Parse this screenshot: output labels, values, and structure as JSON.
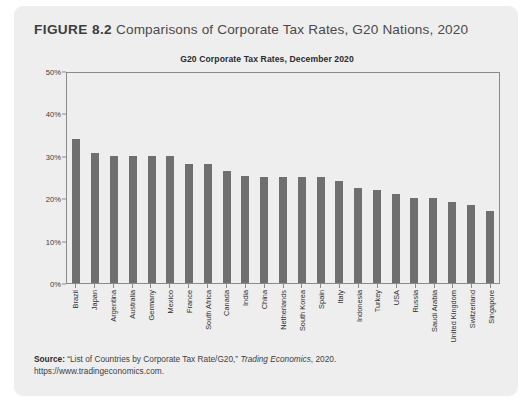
{
  "figure": {
    "number_label": "FIGURE 8.2",
    "caption": "Comparisons of Corporate Tax Rates, G20 Nations, 2020"
  },
  "source": {
    "label": "Source:",
    "citation_start": " “List of Countries by Corporate Tax Rate/G20,” ",
    "publication": "Trading Economics",
    "citation_end": ", 2020.",
    "url": "https://www.tradingeconomics.com."
  },
  "colors": {
    "card_background": "#eeeeee",
    "bar_fill": "#6f6f6f",
    "axis_line": "#8a8a8a",
    "heading_text": "#4a4a4a"
  },
  "chart_data": {
    "type": "bar",
    "title": "G20 Corporate Tax Rates, December 2020",
    "xlabel": "",
    "ylabel": "",
    "ylim": [
      0,
      50
    ],
    "ytick_labels": [
      "0%",
      "10%",
      "20%",
      "30%",
      "40%",
      "50%"
    ],
    "ytick_values": [
      0,
      10,
      20,
      30,
      40,
      50
    ],
    "grid": false,
    "legend": false,
    "orientation": "vertical",
    "value_unit": "percent",
    "categories": [
      "Brazil",
      "Japan",
      "Argentina",
      "Australia",
      "Germany",
      "Mexico",
      "France",
      "South Africa",
      "Canada",
      "India",
      "China",
      "Netherlands",
      "South Korea",
      "Spain",
      "Italy",
      "Indonesia",
      "Turkey",
      "USA",
      "Russia",
      "Saudi Arabia",
      "United Kingdom",
      "Switzerland",
      "Singapore"
    ],
    "values": [
      34.0,
      30.6,
      30.0,
      30.0,
      30.0,
      30.0,
      28.0,
      28.0,
      26.5,
      25.2,
      25.0,
      25.0,
      25.0,
      25.0,
      24.0,
      22.5,
      22.0,
      21.0,
      20.0,
      20.0,
      19.0,
      18.5,
      17.0
    ]
  }
}
